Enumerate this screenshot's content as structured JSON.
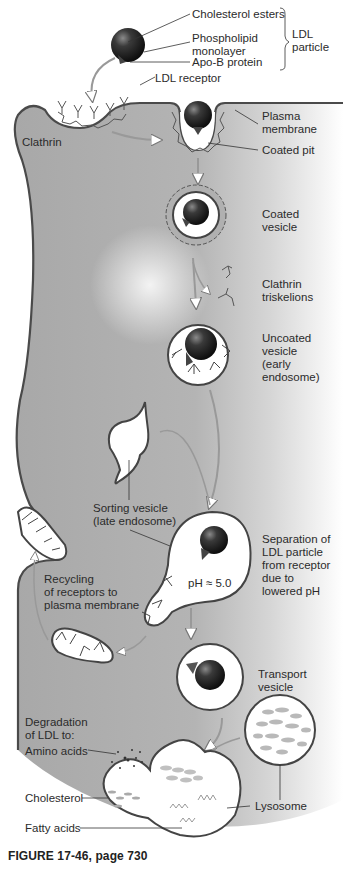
{
  "figure": {
    "caption": "FIGURE 17-46, page 730",
    "colors": {
      "cytoplasm": "#a9a9a9",
      "membrane": "#4a4a4a",
      "vesicle_fill": "#ffffff",
      "particle": "#1e1e1e",
      "clathrin": "#555555",
      "arrow": "#9a9a9a"
    }
  },
  "labels": {
    "cholesterol_esters": "Cholesterol esters",
    "phospholipid_monolayer": "Phospholipid\nmonolayer",
    "apo_b_protein": "Apo-B protein",
    "ldl_particle": "LDL\nparticle",
    "ldl_receptor": "LDL receptor",
    "clathrin": "Clathrin",
    "plasma_membrane": "Plasma\nmembrane",
    "coated_pit": "Coated pit",
    "coated_vesicle": "Coated\nvesicle",
    "clathrin_triskelions": "Clathrin\ntriskelions",
    "uncoated_vesicle": "Uncoated\nvesicle\n(early\nendosome)",
    "sorting_vesicle": "Sorting vesicle\n(late endosome)",
    "separation": "Separation of\nLDL particle\nfrom receptor\ndue to\nlowered pH",
    "ph_value": "pH ≈ 5.0",
    "recycling": "Recycling\nof receptors to\nplasma membrane",
    "transport_vesicle": "Transport\nvesicle",
    "degradation": "Degradation\nof LDL to:",
    "amino_acids": "Amino acids",
    "cholesterol": "Cholesterol",
    "fatty_acids": "Fatty acids",
    "lysosome": "Lysosome"
  }
}
